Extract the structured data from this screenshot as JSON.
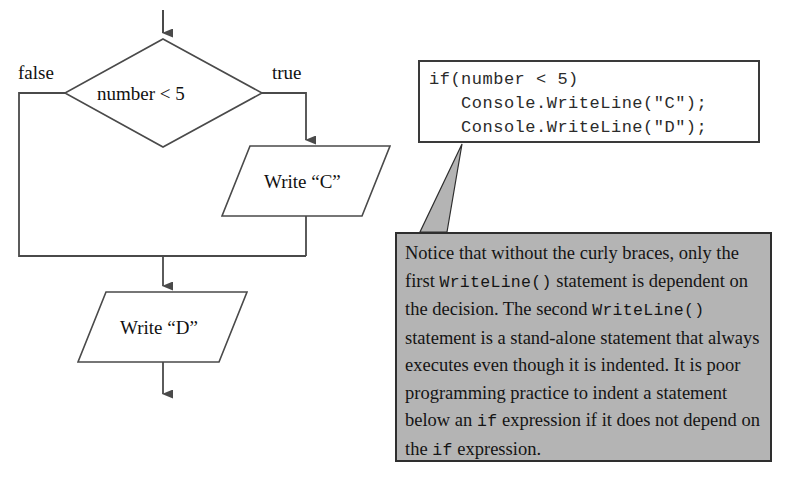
{
  "diagram": {
    "title_absent": true,
    "decision": {
      "text": "number < 5",
      "shape": "diamond"
    },
    "branches": {
      "false_label": "false",
      "true_label": "true"
    },
    "process_c": {
      "text": "Write “C”",
      "shape": "parallelogram"
    },
    "process_d": {
      "text": "Write “D”",
      "shape": "parallelogram"
    }
  },
  "code_box": {
    "lines": [
      "if(number < 5)",
      "   Console.WriteLine(\"C\");",
      "   Console.WriteLine(\"D\");"
    ]
  },
  "callout": {
    "segments": [
      {
        "text": "Notice that without the curly braces, only the first ",
        "mono": false
      },
      {
        "text": "WriteLine()",
        "mono": true
      },
      {
        "text": " statement is dependent on the decision. The second ",
        "mono": false
      },
      {
        "text": "WriteLine()",
        "mono": true
      },
      {
        "text": " statement is a stand-alone statement that always executes even though it is indented. It is poor programming practice to indent a statement below an ",
        "mono": false
      },
      {
        "text": "if",
        "mono": true
      },
      {
        "text": " expression if it does not depend on the ",
        "mono": false
      },
      {
        "text": "if",
        "mono": true
      },
      {
        "text": " expression.",
        "mono": false
      }
    ],
    "background_color": "#b4b4b4",
    "border_color": "#2e2e2e"
  },
  "style": {
    "stroke_color": "#4a4a4a",
    "text_color": "#111111",
    "page_background": "#ffffff"
  }
}
